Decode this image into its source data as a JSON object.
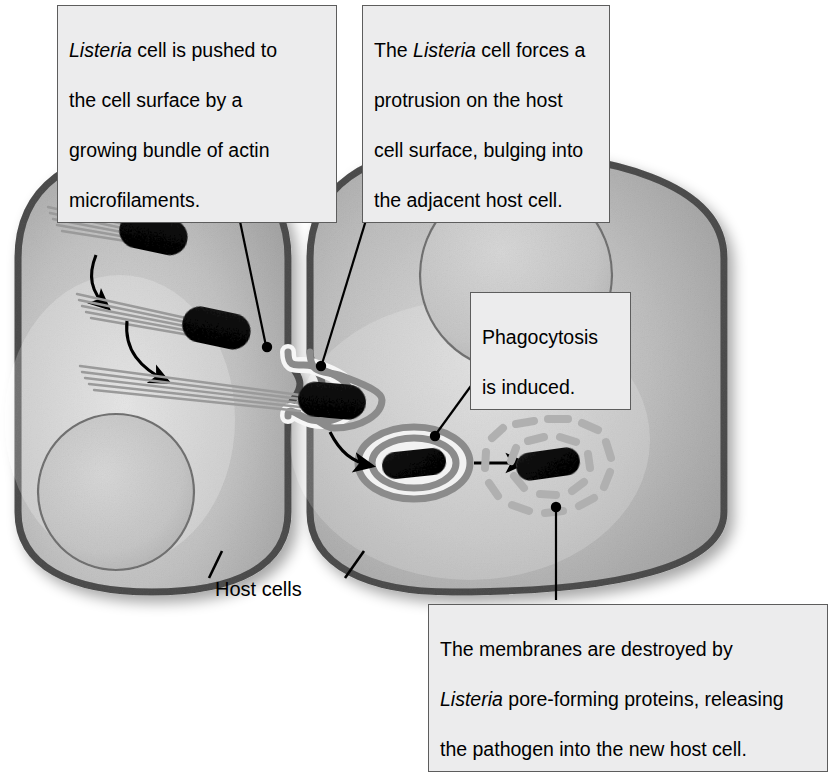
{
  "figure": {
    "topic": "Listeria cell-to-cell spread",
    "background_color": "#ffffff"
  },
  "callouts": {
    "push": {
      "id": "listeria-pushed-to-surface",
      "text_plain": "Listeria cell is pushed to the cell surface by a growing bundle of actin microfilaments.",
      "line1_italic": "Listeria",
      "line1_rest": " cell is pushed to",
      "line2": "the cell surface by a",
      "line3": "growing bundle of actin",
      "line4": "microfilaments."
    },
    "force": {
      "id": "listeria-forces-protrusion",
      "text_plain": "The Listeria cell forces a protrusion on the host cell surface, bulging into the adjacent host cell.",
      "line1_pre": "The ",
      "line1_italic": "Listeria",
      "line1_rest": " cell forces a",
      "line2": "protrusion on the host",
      "line3": "cell surface, bulging into",
      "line4": "the adjacent host cell."
    },
    "phagocytosis": {
      "id": "phagocytosis-induced",
      "text_plain": "Phagocytosis is induced.",
      "line1": "Phagocytosis",
      "line2": "is induced."
    },
    "destroy": {
      "id": "membranes-destroyed",
      "text_plain": "The membranes are destroyed by Listeria pore-forming proteins, releasing the pathogen into the new host cell.",
      "line1": "The membranes are destroyed by",
      "line2_italic": "Listeria",
      "line2_rest": " pore-forming proteins, releasing",
      "line3": "the pathogen into the new host cell."
    }
  },
  "labels": {
    "host_cells": "Host cells"
  },
  "colors": {
    "callout_fill": "#ececed",
    "callout_border": "#5d5d5d",
    "membrane": "#8b8b8b",
    "membrane_dark": "#6f6f6f",
    "cytoplasm_light": "#e2e2e2",
    "cytoplasm_mid": "#cfcfcf",
    "nucleus": "#dcdcdc",
    "nucleus_outline": "#a9a9a9",
    "bacterium": "#3a3a3a",
    "actin": "#9a9a9a",
    "leader_line": "#000000",
    "degraded_membrane": "#b0b0b0"
  },
  "structures": {
    "left_cell": "host-cell-left",
    "right_cell": "host-cell-right",
    "left_nucleus": "nucleus-left",
    "right_nucleus": "nucleus-right",
    "bacteria_with_actin_tails": 3,
    "protrusion": "membrane-protrusion-into-adjacent-cell",
    "vacuole": "double-membrane-vacuole",
    "freed_bacterium": "bacterium-released-in-new-host",
    "curved_arrows": 3,
    "straight_arrow": 1
  }
}
